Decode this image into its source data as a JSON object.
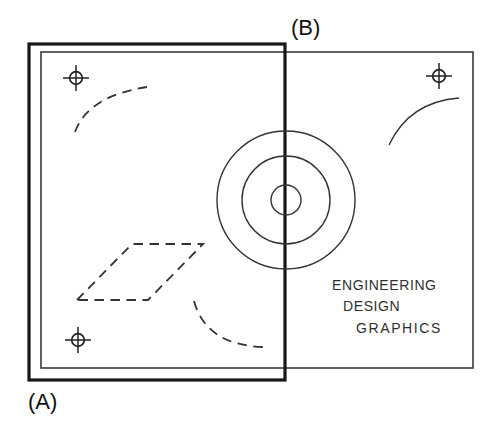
{
  "figure": {
    "label_a": "(A)",
    "label_b": "(B)",
    "title_block": {
      "line1": "ENGINEERING",
      "line2": "DESIGN",
      "line3": "GRAPHICS"
    }
  },
  "icons": {
    "registration_mark": "⊕"
  },
  "colors": {
    "background": "#ffffff",
    "thin_line": "#3a3a3a",
    "thick_line": "#1a1a1a",
    "dashed_line": "#333333",
    "text": "#2f2f2f",
    "label_text": "#111111"
  }
}
